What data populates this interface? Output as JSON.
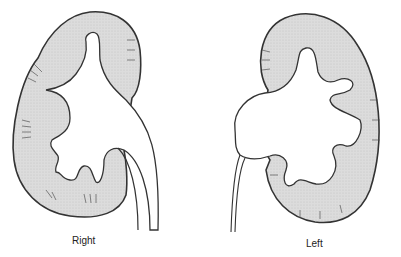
{
  "figure": {
    "kidneys": [
      {
        "id": "right",
        "label": "Right"
      },
      {
        "id": "left",
        "label": "Left"
      }
    ],
    "colors": {
      "cortex_fill": "#d9d9d9",
      "outline": "#333333",
      "sinus_fill": "#ffffff"
    }
  }
}
